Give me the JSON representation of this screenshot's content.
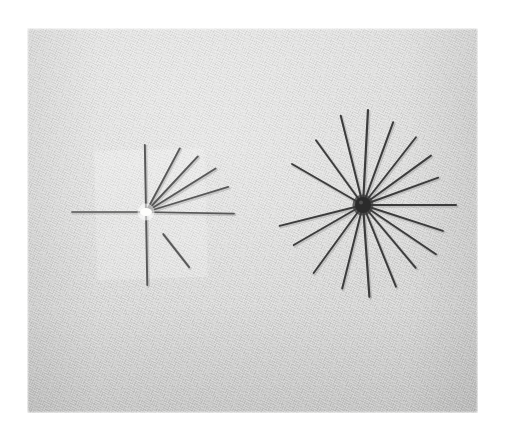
{
  "image": {
    "kind": "photograph",
    "subject": "two-starburst-pin-arrangements",
    "caption": "Two radial arrangements of straight pins laid on light gray woven fabric; the left arrangement is sparse with a bright white center bead, the right arrangement is a dense full starburst with a dark center bead.",
    "width_px": 505,
    "height_px": 439,
    "border_color": "#ffffff",
    "panel": {
      "left": 27,
      "top": 28,
      "width": 451,
      "height": 385,
      "background_color": "#d9d9d9",
      "texture": "woven-twill-fabric",
      "tone_light": "#e2e2e1",
      "tone_dark": "#cdcdcc"
    }
  },
  "tape_patch": {
    "label": "translucent-film-rectangle",
    "left": 96,
    "top": 150,
    "width": 110,
    "height": 128,
    "rotation_deg": -1.5,
    "opacity": 0.45,
    "color": "#ffffff"
  },
  "clusters": [
    {
      "id": "left-cluster",
      "label": "Sparse pin starburst",
      "hub": {
        "x": 146,
        "y": 212,
        "type": "bright",
        "color": "#fdfdfb",
        "radius": 5
      },
      "stroke_color": "#585858",
      "spoke_count": 9,
      "spokes": [
        {
          "name": "up",
          "angle_deg": -91,
          "length": 67,
          "width": 1.9,
          "detached": false
        },
        {
          "name": "down",
          "angle_deg": 89,
          "length": 73,
          "width": 1.9,
          "detached": false
        },
        {
          "name": "left",
          "angle_deg": 180,
          "length": 74,
          "width": 1.7,
          "detached": false
        },
        {
          "name": "right",
          "angle_deg": 1,
          "length": 88,
          "width": 1.7,
          "detached": false
        },
        {
          "name": "up-right-steep",
          "angle_deg": -62,
          "length": 72,
          "width": 1.9,
          "detached": false
        },
        {
          "name": "up-right-mid",
          "angle_deg": -47,
          "length": 76,
          "width": 1.9,
          "detached": false
        },
        {
          "name": "up-right-low",
          "angle_deg": -32,
          "length": 82,
          "width": 1.9,
          "detached": false
        },
        {
          "name": "up-right-flat",
          "angle_deg": -17,
          "length": 86,
          "width": 1.7,
          "detached": false
        },
        {
          "name": "down-right-detached",
          "angle_deg": 52,
          "length": 70,
          "width": 1.9,
          "detached": true,
          "gap": 28
        }
      ]
    },
    {
      "id": "right-cluster",
      "label": "Dense pin starburst",
      "hub": {
        "x": 363,
        "y": 205,
        "type": "dark",
        "color": "#2b2b2b",
        "radius": 8
      },
      "stroke_color": "#3c3c3c",
      "spoke_count": 16,
      "spokes": [
        {
          "name": "s01",
          "angle_deg": -104,
          "length": 92,
          "width": 2.0
        },
        {
          "name": "s02",
          "angle_deg": -87,
          "length": 95,
          "width": 2.2
        },
        {
          "name": "s03",
          "angle_deg": -70,
          "length": 88,
          "width": 2.0
        },
        {
          "name": "s04",
          "angle_deg": -52,
          "length": 86,
          "width": 1.9
        },
        {
          "name": "s05",
          "angle_deg": -36,
          "length": 84,
          "width": 1.9
        },
        {
          "name": "s06",
          "angle_deg": -20,
          "length": 80,
          "width": 1.9
        },
        {
          "name": "s07",
          "angle_deg": 0,
          "length": 93,
          "width": 2.0
        },
        {
          "name": "s08",
          "angle_deg": 18,
          "length": 84,
          "width": 1.9
        },
        {
          "name": "s09",
          "angle_deg": 34,
          "length": 88,
          "width": 1.9
        },
        {
          "name": "s10",
          "angle_deg": 50,
          "length": 82,
          "width": 1.9
        },
        {
          "name": "s11",
          "angle_deg": 68,
          "length": 88,
          "width": 2.0
        },
        {
          "name": "s12",
          "angle_deg": 86,
          "length": 92,
          "width": 2.2
        },
        {
          "name": "s13",
          "angle_deg": 104,
          "length": 86,
          "width": 2.0
        },
        {
          "name": "s14",
          "angle_deg": 126,
          "length": 84,
          "width": 1.9
        },
        {
          "name": "s15",
          "angle_deg": 150,
          "length": 80,
          "width": 1.9
        },
        {
          "name": "s16",
          "angle_deg": 166,
          "length": 86,
          "width": 1.9
        },
        {
          "name": "s17",
          "angle_deg": -150,
          "length": 82,
          "width": 1.9
        },
        {
          "name": "s18",
          "angle_deg": -126,
          "length": 80,
          "width": 1.9
        }
      ]
    }
  ]
}
